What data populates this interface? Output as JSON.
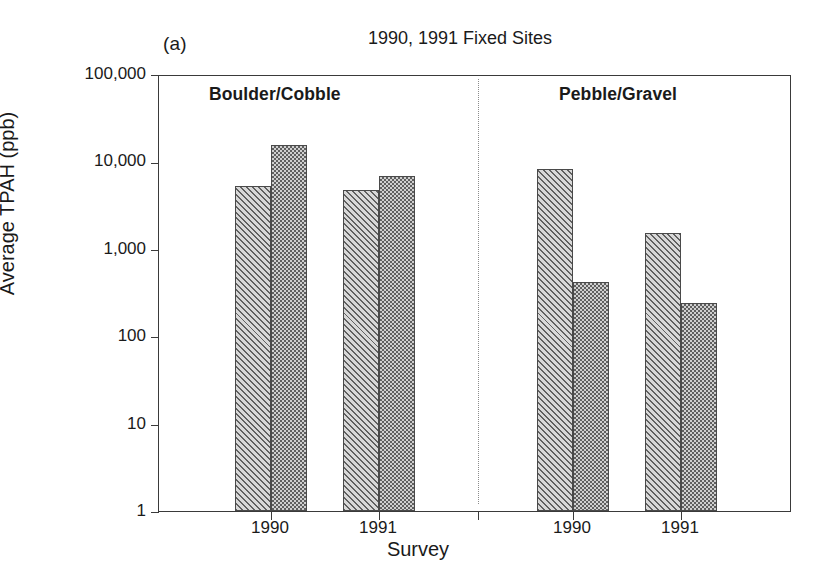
{
  "figure": {
    "panel_letter": "(a)",
    "title": "1990, 1991 Fixed Sites",
    "xlabel": "Survey",
    "ylabel": "Average TPAH (ppb)"
  },
  "chart_data": {
    "type": "bar",
    "title": "1990, 1991 Fixed Sites",
    "xlabel": "Survey",
    "ylabel": "Average TPAH (ppb)",
    "yscale": "log",
    "ylim": [
      1,
      100000
    ],
    "ytick_labels": [
      "100,000",
      "10,000",
      "1,000",
      "100",
      "10",
      "1"
    ],
    "ytick_values": [
      100000,
      10000,
      1000,
      100,
      10,
      1
    ],
    "grid": false,
    "legend": "none",
    "categories": [
      "1990",
      "1991",
      "1990",
      "1991"
    ],
    "group_labels": [
      "Boulder/Cobble",
      "Pebble/Gravel"
    ],
    "group_spans": [
      [
        0,
        1
      ],
      [
        2,
        3
      ]
    ],
    "series": [
      {
        "name": "series-light",
        "values": [
          5300,
          4700,
          8200,
          1500
        ]
      },
      {
        "name": "series-dark",
        "values": [
          15500,
          6800,
          420,
          240
        ]
      }
    ],
    "bars": [
      {
        "group": "Boulder/Cobble",
        "survey": "1990",
        "series": "series-light",
        "value": 5300
      },
      {
        "group": "Boulder/Cobble",
        "survey": "1990",
        "series": "series-dark",
        "value": 15500
      },
      {
        "group": "Boulder/Cobble",
        "survey": "1991",
        "series": "series-light",
        "value": 4700
      },
      {
        "group": "Boulder/Cobble",
        "survey": "1991",
        "series": "series-dark",
        "value": 6800
      },
      {
        "group": "Pebble/Gravel",
        "survey": "1990",
        "series": "series-light",
        "value": 8200
      },
      {
        "group": "Pebble/Gravel",
        "survey": "1990",
        "series": "series-dark",
        "value": 420
      },
      {
        "group": "Pebble/Gravel",
        "survey": "1991",
        "series": "series-light",
        "value": 1500
      },
      {
        "group": "Pebble/Gravel",
        "survey": "1991",
        "series": "series-dark",
        "value": 240
      }
    ],
    "colors": {
      "axis": "#3a3a3a",
      "series_light": "#d8d8d8",
      "series_dark": "#8e8e8e",
      "divider": "#8b8b8b",
      "background": "#ffffff"
    }
  },
  "layout": {
    "bar_x_left": [
      76,
      112,
      184,
      220,
      378,
      414,
      486,
      522
    ],
    "bar_width": 36,
    "xtick_x": [
      112,
      220,
      319,
      414,
      522
    ],
    "divider_x": 319
  }
}
